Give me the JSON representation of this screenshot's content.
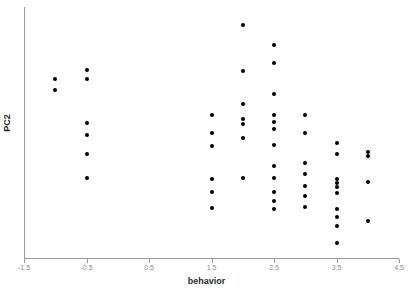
{
  "chart_data": {
    "type": "scatter",
    "title": "",
    "xlabel": "behavior",
    "ylabel": "PC2",
    "xlim": [
      -1.5,
      4.5
    ],
    "ylim": [
      0,
      1
    ],
    "xticks": [
      -1.5,
      -0.5,
      0.5,
      1.5,
      2.5,
      3.5,
      4.5
    ],
    "xtick_labels": [
      "-1.5",
      "-0.5",
      "0.5",
      "1.5",
      "2.5",
      "3.5",
      "4.5"
    ],
    "yticks": [],
    "ytick_labels": [],
    "grid": false,
    "legend": null,
    "marker_color": "#000000",
    "axis_color": "#9a9a9a",
    "tick_label_color": "#8c8c8c",
    "points": [
      {
        "x": -1.0,
        "y": 0.713
      },
      {
        "x": -1.0,
        "y": 0.669
      },
      {
        "x": -0.5,
        "y": 0.749
      },
      {
        "x": -0.5,
        "y": 0.713
      },
      {
        "x": -0.5,
        "y": 0.538
      },
      {
        "x": -0.5,
        "y": 0.49
      },
      {
        "x": -0.5,
        "y": 0.414
      },
      {
        "x": -0.5,
        "y": 0.319
      },
      {
        "x": 1.5,
        "y": 0.57
      },
      {
        "x": 1.5,
        "y": 0.498
      },
      {
        "x": 1.5,
        "y": 0.446
      },
      {
        "x": 1.5,
        "y": 0.315
      },
      {
        "x": 1.5,
        "y": 0.263
      },
      {
        "x": 1.5,
        "y": 0.199
      },
      {
        "x": 2.0,
        "y": 0.928
      },
      {
        "x": 2.0,
        "y": 0.745
      },
      {
        "x": 2.0,
        "y": 0.614
      },
      {
        "x": 2.0,
        "y": 0.554
      },
      {
        "x": 2.0,
        "y": 0.534
      },
      {
        "x": 2.0,
        "y": 0.478
      },
      {
        "x": 2.0,
        "y": 0.319
      },
      {
        "x": 2.5,
        "y": 0.849
      },
      {
        "x": 2.5,
        "y": 0.777
      },
      {
        "x": 2.5,
        "y": 0.653
      },
      {
        "x": 2.5,
        "y": 0.57
      },
      {
        "x": 2.5,
        "y": 0.542
      },
      {
        "x": 2.5,
        "y": 0.514
      },
      {
        "x": 2.5,
        "y": 0.45
      },
      {
        "x": 2.5,
        "y": 0.367
      },
      {
        "x": 2.5,
        "y": 0.319
      },
      {
        "x": 2.5,
        "y": 0.263
      },
      {
        "x": 2.5,
        "y": 0.227
      },
      {
        "x": 2.5,
        "y": 0.195
      },
      {
        "x": 3.0,
        "y": 0.57
      },
      {
        "x": 3.0,
        "y": 0.498
      },
      {
        "x": 3.0,
        "y": 0.379
      },
      {
        "x": 3.0,
        "y": 0.335
      },
      {
        "x": 3.0,
        "y": 0.287
      },
      {
        "x": 3.0,
        "y": 0.247
      },
      {
        "x": 3.0,
        "y": 0.203
      },
      {
        "x": 3.5,
        "y": 0.458
      },
      {
        "x": 3.5,
        "y": 0.414
      },
      {
        "x": 3.5,
        "y": 0.315
      },
      {
        "x": 3.5,
        "y": 0.299
      },
      {
        "x": 3.5,
        "y": 0.283
      },
      {
        "x": 3.5,
        "y": 0.259
      },
      {
        "x": 3.5,
        "y": 0.195
      },
      {
        "x": 3.5,
        "y": 0.163
      },
      {
        "x": 3.5,
        "y": 0.127
      },
      {
        "x": 3.5,
        "y": 0.06
      },
      {
        "x": 4.0,
        "y": 0.422
      },
      {
        "x": 4.0,
        "y": 0.406
      },
      {
        "x": 4.0,
        "y": 0.303
      },
      {
        "x": 4.0,
        "y": 0.148
      }
    ]
  },
  "axes": {
    "x_title": "behavior",
    "y_title": "PC2"
  }
}
